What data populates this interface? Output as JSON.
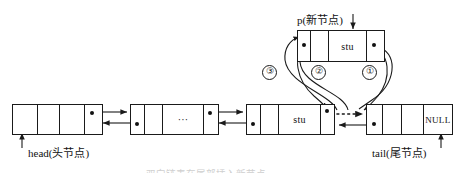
{
  "diagram": {
    "caption": "双向链表在尾部插入新节点",
    "pointer_label_new": "p(新节点)",
    "pointer_label_head": "head(头节点)",
    "pointer_label_tail": "tail(尾节点)",
    "step_marks": [
      "③",
      "②",
      "①"
    ],
    "colors": {
      "stroke": "#1a1a1a",
      "fill": "#ffffff",
      "text": "#111111",
      "caption": "#cfcfcf"
    }
  },
  "new_node": {
    "name": "new-node",
    "cells": [
      {
        "text": "",
        "kind": "prev-pointer"
      },
      {
        "text": "",
        "kind": "empty"
      },
      {
        "text": "stu",
        "kind": "data"
      },
      {
        "text": "",
        "kind": "next-pointer"
      }
    ]
  },
  "list_nodes": [
    {
      "name": "head-node",
      "cells": [
        {
          "text": "",
          "kind": "empty"
        },
        {
          "text": "",
          "kind": "empty"
        },
        {
          "text": "",
          "kind": "data"
        },
        {
          "text": "",
          "kind": "next-pointer"
        }
      ]
    },
    {
      "name": "middle-node",
      "cells": [
        {
          "text": "",
          "kind": "prev-pointer"
        },
        {
          "text": "",
          "kind": "empty"
        },
        {
          "text": "···",
          "kind": "data"
        },
        {
          "text": "",
          "kind": "next-pointer"
        }
      ]
    },
    {
      "name": "stu-node",
      "cells": [
        {
          "text": "",
          "kind": "prev-pointer"
        },
        {
          "text": "",
          "kind": "empty"
        },
        {
          "text": "stu",
          "kind": "data"
        },
        {
          "text": "",
          "kind": "next-pointer"
        }
      ]
    },
    {
      "name": "tail-node",
      "cells": [
        {
          "text": "",
          "kind": "prev-pointer"
        },
        {
          "text": "",
          "kind": "empty"
        },
        {
          "text": "",
          "kind": "data"
        },
        {
          "text": "NULL",
          "kind": "null"
        }
      ]
    }
  ]
}
